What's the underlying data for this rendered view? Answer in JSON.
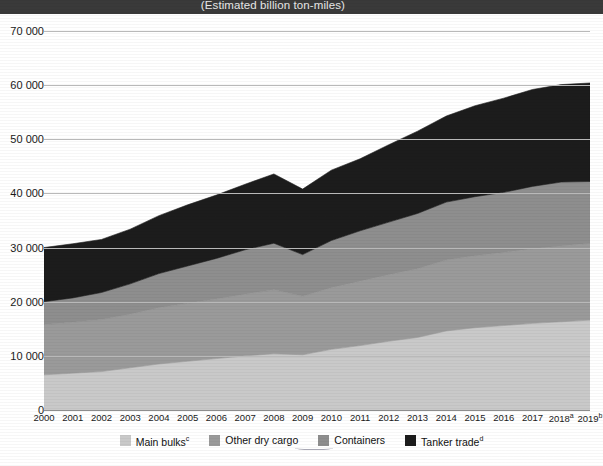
{
  "header": {
    "unit_caption": "(Estimated billion ton-miles)"
  },
  "legend": {
    "items": [
      {
        "label": "Main bulks",
        "sup": "c",
        "color": "#c9c9c9",
        "name": "main-bulks"
      },
      {
        "label": "Other dry cargo",
        "sup": "",
        "color": "#9a9a9a",
        "name": "other-dry-cargo"
      },
      {
        "label": "Containers",
        "sup": "",
        "color": "#8e8e8e",
        "name": "containers"
      },
      {
        "label": "Tanker trade",
        "sup": "d",
        "color": "#1c1c1c",
        "name": "tanker-trade"
      }
    ]
  },
  "chart_data": {
    "type": "area",
    "stacked": true,
    "title": "",
    "subtitle": "(Estimated billion ton-miles)",
    "xlabel": "",
    "ylabel": "",
    "ylim": [
      0,
      70000
    ],
    "yticks": [
      0,
      10000,
      20000,
      30000,
      40000,
      50000,
      60000,
      70000
    ],
    "ytick_labels": [
      "0",
      "10 000",
      "20 000",
      "30 000",
      "40 000",
      "50 000",
      "60 000",
      "70 000"
    ],
    "grid": true,
    "legend_position": "bottom",
    "categories": [
      "2000",
      "2001",
      "2002",
      "2003",
      "2004",
      "2005",
      "2006",
      "2007",
      "2008",
      "2009",
      "2010",
      "2011",
      "2012",
      "2013",
      "2014",
      "2015",
      "2016",
      "2017",
      "2018",
      "2019"
    ],
    "category_superscripts": {
      "2018": "a",
      "2019": "b"
    },
    "series": [
      {
        "name": "Main bulks",
        "color": "#c9c9c9",
        "values": [
          6500,
          6800,
          7100,
          7800,
          8500,
          9000,
          9500,
          10000,
          10400,
          10200,
          11200,
          11900,
          12700,
          13400,
          14600,
          15200,
          15600,
          16000,
          16300,
          16600
        ]
      },
      {
        "name": "Other dry cargo",
        "color": "#9a9a9a",
        "values": [
          9300,
          9400,
          9600,
          9900,
          10400,
          10700,
          11000,
          11400,
          11800,
          10800,
          11400,
          11900,
          12300,
          12700,
          13100,
          13300,
          13500,
          13800,
          14000,
          14200
        ]
      },
      {
        "name": "Containers",
        "color": "#8e8e8e",
        "values": [
          4200,
          4500,
          5000,
          5600,
          6300,
          6900,
          7500,
          8200,
          8600,
          7700,
          8700,
          9300,
          9700,
          10200,
          10700,
          10900,
          11100,
          11500,
          11800,
          11400
        ]
      },
      {
        "name": "Tanker trade",
        "color": "#1c1c1c",
        "values": [
          10000,
          10000,
          9800,
          10100,
          10700,
          11300,
          11700,
          12100,
          12800,
          12100,
          13000,
          13300,
          14300,
          15200,
          15900,
          16800,
          17400,
          17900,
          18000,
          18200
        ]
      }
    ],
    "totals": [
      30000,
      30700,
      31500,
      33400,
      35900,
      37900,
      39700,
      41700,
      43600,
      40800,
      44300,
      46400,
      49000,
      51500,
      54300,
      56200,
      57600,
      59200,
      60100,
      60400
    ]
  }
}
